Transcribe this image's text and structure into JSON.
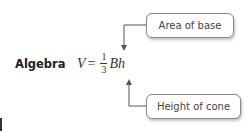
{
  "label": "Algebra",
  "formula": {
    "lhs": "V",
    "equals": "=",
    "numerator": "1",
    "denominator": "3",
    "rhs": "Bh"
  },
  "callouts": [
    {
      "text": "Area of base"
    },
    {
      "text": "Height of cone"
    }
  ]
}
